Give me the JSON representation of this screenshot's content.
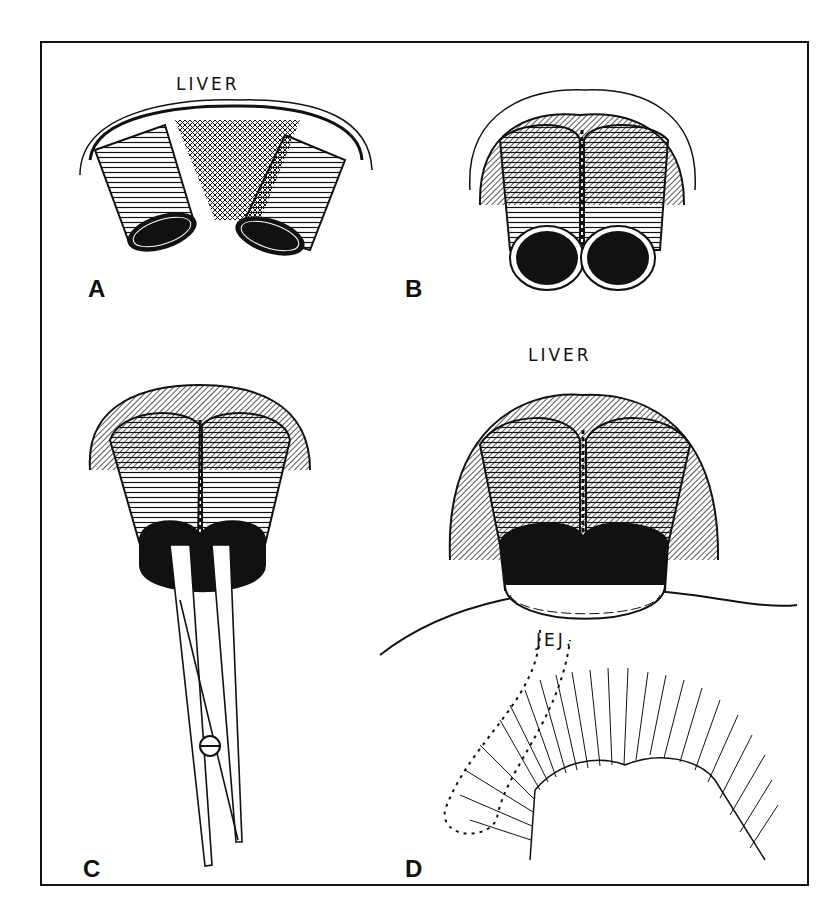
{
  "figure": {
    "colors": {
      "ink": "#111111",
      "paper": "#ffffff"
    },
    "panels": [
      {
        "id": "A",
        "label": "A",
        "annotations": [
          "LIVER"
        ],
        "content": "Two separated duct ends below the liver"
      },
      {
        "id": "B",
        "label": "B",
        "content": "Two duct ends sutured together side-by-side"
      },
      {
        "id": "C",
        "label": "C",
        "content": "Sutured ducts with scissors inserted to divide the septum"
      },
      {
        "id": "D",
        "label": "D",
        "annotations": [
          "LIVER",
          "JEJ."
        ],
        "content": "Common orifice anastomosed to jejunal loop"
      }
    ]
  }
}
